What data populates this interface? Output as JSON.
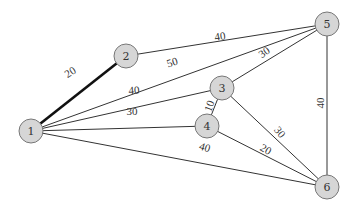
{
  "diagram": {
    "type": "weighted-undirected-graph",
    "nodes": [
      {
        "id": "1",
        "label": "1",
        "x": 31,
        "y": 131
      },
      {
        "id": "2",
        "label": "2",
        "x": 126,
        "y": 56
      },
      {
        "id": "3",
        "label": "3",
        "x": 222,
        "y": 88
      },
      {
        "id": "4",
        "label": "4",
        "x": 207,
        "y": 126
      },
      {
        "id": "5",
        "label": "5",
        "x": 327,
        "y": 24
      },
      {
        "id": "6",
        "label": "6",
        "x": 327,
        "y": 187
      }
    ],
    "edges": [
      {
        "from": "1",
        "to": "2",
        "weight": "20",
        "bold": true,
        "lx": 70,
        "ly": 72,
        "rot": -33
      },
      {
        "from": "1",
        "to": "5",
        "weight": "50",
        "bold": false,
        "lx": 172,
        "ly": 62,
        "rot": -17
      },
      {
        "from": "1",
        "to": "3",
        "weight": "40",
        "bold": false,
        "lx": 134,
        "ly": 90,
        "rot": -4
      },
      {
        "from": "1",
        "to": "4",
        "weight": "30",
        "bold": false,
        "lx": 132,
        "ly": 111,
        "rot": 0
      },
      {
        "from": "1",
        "to": "6",
        "weight": "40",
        "bold": false,
        "lx": 205,
        "ly": 147,
        "rot": 17
      },
      {
        "from": "2",
        "to": "5",
        "weight": "40",
        "bold": false,
        "lx": 220,
        "ly": 36,
        "rot": -8
      },
      {
        "from": "3",
        "to": "5",
        "weight": "30",
        "bold": false,
        "lx": 264,
        "ly": 52,
        "rot": -35
      },
      {
        "from": "3",
        "to": "4",
        "weight": "10",
        "bold": false,
        "lx": 209,
        "ly": 106,
        "rot": -70
      },
      {
        "from": "3",
        "to": "6",
        "weight": "30",
        "bold": false,
        "lx": 280,
        "ly": 132,
        "rot": 50
      },
      {
        "from": "4",
        "to": "6",
        "weight": "20",
        "bold": false,
        "lx": 266,
        "ly": 149,
        "rot": 30
      },
      {
        "from": "5",
        "to": "6",
        "weight": "40",
        "bold": false,
        "lx": 320,
        "ly": 103,
        "rot": -90
      }
    ],
    "colors": {
      "node_fill": "#d6d6d6",
      "node_stroke": "#777777",
      "edge": "#333333",
      "text": "#333333"
    }
  }
}
